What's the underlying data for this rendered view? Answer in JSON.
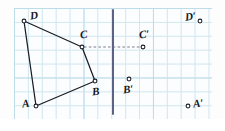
{
  "figure": {
    "background_color": "#fdfdfd",
    "grid": {
      "minor_color": "#cfe6ef",
      "major_color": "#b9dbe8",
      "minor_spacing_px": 13.9,
      "major_spacing_px": 69.5,
      "origin_x": 14,
      "origin_y": 8,
      "width": 198,
      "height": 111
    },
    "mirror_line": {
      "label": "mirror-line",
      "color": "#4a5378",
      "x": 113,
      "y_top": 10,
      "y_bottom": 114,
      "width": 1.8
    },
    "stroke_color": "#1b1c24",
    "dash_color": "#6b7180"
  },
  "shape": {
    "name": "ABCD",
    "vertices": [
      {
        "id": "A",
        "label": "A",
        "x": 36,
        "y": 106,
        "label_x": 22,
        "label_y": 98
      },
      {
        "id": "B",
        "label": "B",
        "x": 95,
        "y": 81,
        "label_x": 92,
        "label_y": 86
      },
      {
        "id": "C",
        "label": "C",
        "x": 82,
        "y": 47,
        "label_x": 80,
        "label_y": 29
      },
      {
        "id": "D",
        "label": "D",
        "x": 24,
        "y": 21,
        "label_x": 30,
        "label_y": 10
      }
    ],
    "edges": [
      {
        "from": "A",
        "to": "B"
      },
      {
        "from": "B",
        "to": "C"
      },
      {
        "from": "C",
        "to": "D"
      },
      {
        "from": "D",
        "to": "A"
      }
    ]
  },
  "image_points": [
    {
      "id": "A-prime",
      "label": "A′",
      "x": 188,
      "y": 106,
      "label_x": 193,
      "label_y": 98
    },
    {
      "id": "B-prime",
      "label": "B′",
      "x": 129,
      "y": 79,
      "label_x": 123,
      "label_y": 84
    },
    {
      "id": "C-prime",
      "label": "C′",
      "x": 143,
      "y": 47,
      "label_x": 139,
      "label_y": 29
    },
    {
      "id": "D-prime",
      "label": "D′",
      "x": 200,
      "y": 21,
      "label_x": 185,
      "label_y": 11
    }
  ],
  "construction_lines": [
    {
      "id": "C-to-C-prime",
      "from_x": 84,
      "from_y": 47,
      "to_x": 141,
      "to_y": 47,
      "style": "dashed"
    }
  ]
}
